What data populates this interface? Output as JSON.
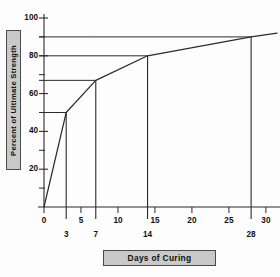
{
  "chart_data": {
    "type": "line",
    "title": "",
    "xlabel": "Days of Curing",
    "ylabel": "Percent of Ultimate Strength",
    "xlim": [
      0,
      31.5
    ],
    "ylim": [
      0,
      100
    ],
    "grid": false,
    "legend": null,
    "x": [
      0,
      3,
      7,
      14,
      28,
      31.5
    ],
    "y": [
      0,
      50,
      67,
      80,
      90,
      92
    ],
    "series": [
      {
        "name": "Strength gain curve",
        "x": [
          0,
          3,
          7,
          14,
          28,
          31.5
        ],
        "values": [
          0,
          50,
          67,
          80,
          90,
          92
        ]
      }
    ],
    "milestones": [
      {
        "day": 3,
        "percent": 50
      },
      {
        "day": 7,
        "percent": 67
      },
      {
        "day": 14,
        "percent": 80
      },
      {
        "day": 28,
        "percent": 90
      }
    ],
    "x_ticks_major": [
      0,
      5,
      10,
      15,
      20,
      25,
      30
    ],
    "x_tick_labels_major": [
      "0",
      "5",
      "10",
      "15",
      "20",
      "25",
      "30"
    ],
    "x_ticks_minor": [
      3,
      7,
      14,
      28
    ],
    "x_tick_labels_minor": [
      "3",
      "7",
      "14",
      "28"
    ],
    "y_ticks_major": [
      20,
      40,
      60,
      80,
      100
    ],
    "y_tick_labels_major": [
      "20",
      "40",
      "60",
      "80",
      "100"
    ],
    "y_ticks_minor": [
      10,
      30,
      50,
      70,
      90
    ]
  },
  "axis_labels": {
    "y_title": "Percent of Ultimate Strength",
    "x_title": "Days of Curing"
  },
  "colors": {
    "line": "#2b2b2b",
    "axis": "#2b2b2b",
    "label_box_fill": "#c9c9c9",
    "label_box_border": "#4a4a4a",
    "background": "#fdfdfd",
    "text": "#111111"
  }
}
